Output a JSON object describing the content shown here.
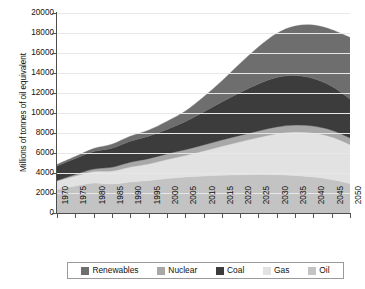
{
  "chart": {
    "type": "area",
    "ylabel": "Millions of tonnes of oil equivalent",
    "xlabel": ""
  },
  "yaxis": {
    "ticks": [
      "0",
      "2000",
      "4000",
      "6000",
      "8000",
      "10000",
      "12000",
      "14000",
      "16000",
      "18000",
      "20000"
    ],
    "min": 0,
    "max": 20000,
    "step": 2000
  },
  "xaxis": {
    "ticks": [
      "1970",
      "1975",
      "1980",
      "1985",
      "1990",
      "1995",
      "2000",
      "2005",
      "2010",
      "2015",
      "2020",
      "2025",
      "2030",
      "2035",
      "2040",
      "2045",
      "2050"
    ]
  },
  "legend": {
    "position": "bottom",
    "items": [
      {
        "label": "Renewables",
        "color": "#6e6e6e"
      },
      {
        "label": "Nuclear",
        "color": "#a8a8a8"
      },
      {
        "label": "Coal",
        "color": "#3c3c3c"
      },
      {
        "label": "Gas",
        "color": "#e2e2e2"
      },
      {
        "label": "Oil",
        "color": "#c3c3c3"
      }
    ]
  },
  "chart_data": {
    "type": "area",
    "stacked": true,
    "title": "",
    "xlabel": "",
    "ylabel": "Millions of tonnes of oil equivalent",
    "ylim": [
      0,
      20000
    ],
    "ytick_step": 2000,
    "grid": true,
    "legend_position": "bottom",
    "x": [
      1970,
      1975,
      1980,
      1985,
      1990,
      1995,
      2000,
      2005,
      2010,
      2015,
      2020,
      2025,
      2030,
      2035,
      2040,
      2045,
      2050
    ],
    "stack_order_bottom_to_top": [
      "Oil",
      "Gas",
      "Nuclear",
      "Coal",
      "Renewables"
    ],
    "series": [
      {
        "name": "Oil",
        "color": "#c3c3c3",
        "values": [
          2350,
          2700,
          3000,
          2900,
          3100,
          3250,
          3450,
          3600,
          3700,
          3780,
          3820,
          3850,
          3830,
          3750,
          3600,
          3350,
          2950
        ]
      },
      {
        "name": "Gas",
        "color": "#e2e2e2",
        "values": [
          850,
          1000,
          1150,
          1300,
          1500,
          1650,
          1900,
          2150,
          2500,
          2900,
          3300,
          3700,
          4100,
          4350,
          4400,
          4250,
          3900
        ]
      },
      {
        "name": "Nuclear",
        "color": "#a8a8a8",
        "values": [
          50,
          150,
          250,
          380,
          480,
          530,
          560,
          580,
          600,
          620,
          640,
          660,
          680,
          690,
          690,
          680,
          660
        ]
      },
      {
        "name": "Coal",
        "color": "#3c3c3c",
        "values": [
          1450,
          1600,
          1750,
          1900,
          2100,
          2250,
          2450,
          2800,
          3300,
          3800,
          4300,
          4700,
          4950,
          4950,
          4750,
          4400,
          3900
        ]
      },
      {
        "name": "Renewables",
        "color": "#6e6e6e",
        "values": [
          150,
          200,
          300,
          400,
          500,
          600,
          800,
          1050,
          1500,
          2100,
          2900,
          3700,
          4400,
          4950,
          5350,
          5650,
          6150
        ]
      }
    ],
    "totals": [
      4850,
      5650,
      6450,
      6880,
      7680,
      8280,
      9160,
      10180,
      11600,
      13200,
      14960,
      16610,
      17960,
      18690,
      18790,
      18330,
      17560
    ]
  }
}
